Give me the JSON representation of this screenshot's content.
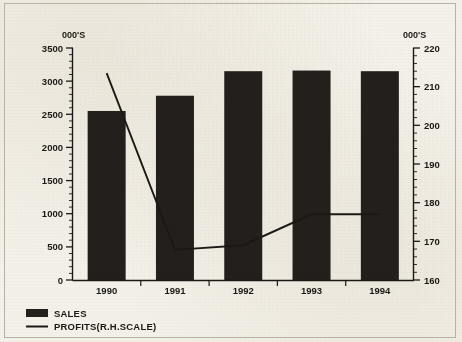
{
  "chart_data": {
    "type": "bar",
    "title": "",
    "subtitle": "",
    "xlabel": "",
    "ylabel": "000'S",
    "y2label": "000'S",
    "categories": [
      "1990",
      "1991",
      "1992",
      "1993",
      "1994"
    ],
    "series": [
      {
        "name": "SALES",
        "type": "bar",
        "axis": "left",
        "color": "#231f1c",
        "values": [
          2550,
          2780,
          3150,
          3160,
          3150
        ]
      },
      {
        "name": "PROFITS(R.H.SCALE)",
        "type": "line",
        "axis": "right",
        "color": "#1b1915",
        "values": [
          213.5,
          167.8,
          169.0,
          177.0,
          177.0
        ]
      }
    ],
    "ylim": [
      0,
      3500
    ],
    "yticks": [
      0,
      500,
      1000,
      1500,
      2000,
      2500,
      3000,
      3500
    ],
    "ytick_labels": [
      "0",
      "500",
      "1000",
      "1500",
      "2000",
      "2500",
      "3000",
      "3500"
    ],
    "y2lim": [
      160,
      220
    ],
    "y2ticks": [
      160,
      170,
      180,
      190,
      200,
      210,
      220
    ],
    "y2tick_labels": [
      "160",
      "170",
      "180",
      "190",
      "200",
      "210",
      "220"
    ],
    "y_minor_step": 100,
    "y2_minor_step": 2,
    "grid": false,
    "legend_position": "bottom-left",
    "legend": [
      {
        "label": "SALES",
        "marker": "filled-bar-swatch",
        "color": "#231f1c"
      },
      {
        "label": "PROFITS(R.H.SCALE)",
        "marker": "line-swatch",
        "color": "#1b1915"
      }
    ]
  },
  "figure": {
    "background_color": "#f4f1ea",
    "ink_color": "#1b1915",
    "frame_color": "#b9b3a4",
    "bar_fill": "#231f1c"
  }
}
